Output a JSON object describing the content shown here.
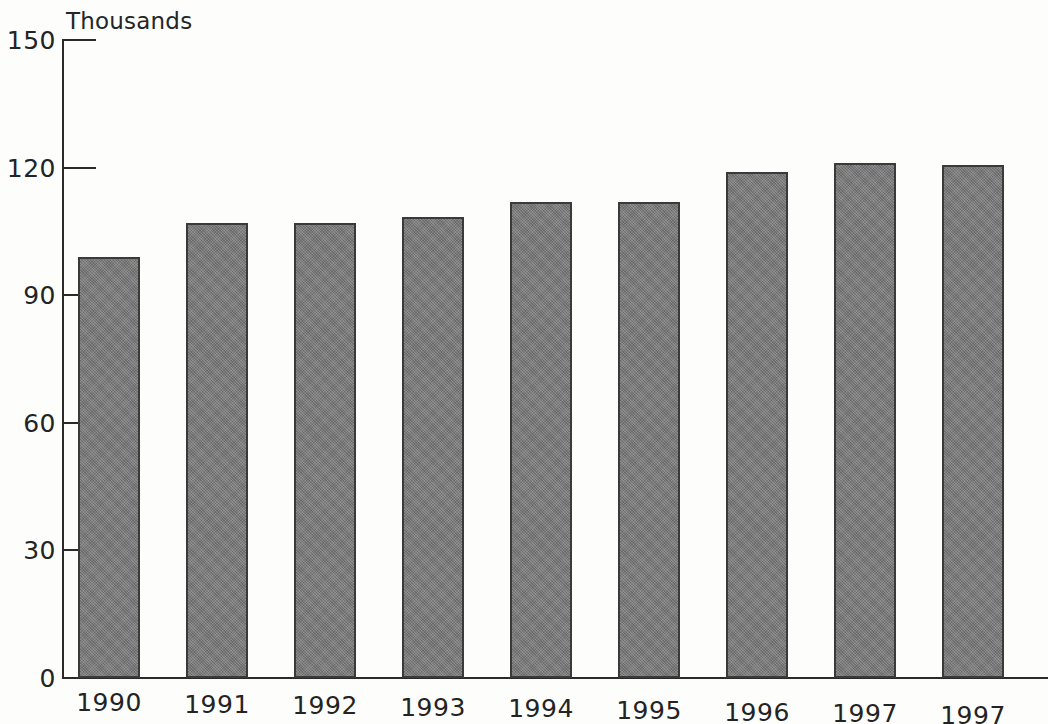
{
  "chart_data": {
    "type": "bar",
    "title": "Thousands",
    "xlabel": "",
    "ylabel": "Thousands",
    "categories": [
      "1990",
      "1991",
      "1992",
      "1993",
      "1994",
      "1995",
      "1996",
      "1997",
      "1997"
    ],
    "values": [
      99,
      107,
      107,
      108.5,
      112,
      112,
      119,
      121,
      120.5
    ],
    "ylim": [
      0,
      150
    ],
    "y_ticks": [
      0,
      30,
      60,
      90,
      120,
      150
    ],
    "y_tick_labels": [
      "0",
      "30",
      "60",
      "90",
      "120",
      "150"
    ],
    "grid": false,
    "legend": null,
    "series": [
      {
        "name": "Thousands",
        "values": [
          99,
          107,
          107,
          108.5,
          112,
          112,
          119,
          121,
          120.5
        ]
      }
    ],
    "bar_color": "#787878",
    "bar_border_color": "#3a3a3a",
    "axis_color": "#2a2a2a",
    "background_color": "#fdfdfc"
  }
}
